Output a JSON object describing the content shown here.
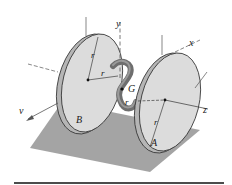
{
  "figure": {
    "labels": {
      "disk_a": "A",
      "disk_b": "B",
      "center_of_mass": "G",
      "axis_x": "x",
      "axis_y": "y",
      "axis_z": "z",
      "velocity": "v",
      "radius": "r"
    },
    "radius_label_count": 4,
    "colors": {
      "disk_face": "#dcdcdc",
      "disk_rim": "#a8a8a8",
      "ground": "#9a9a9a",
      "rod": "#6e6e6e",
      "line": "#1a1a1a",
      "axis": "#555555"
    }
  }
}
